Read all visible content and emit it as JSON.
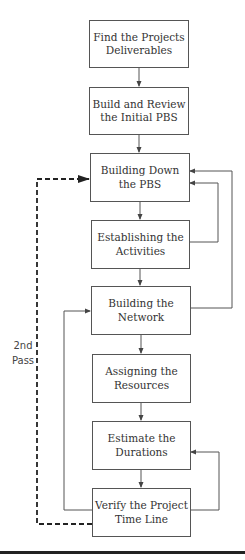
{
  "diagram": {
    "type": "flowchart",
    "nodes": [
      {
        "id": "n1",
        "label": "Find the Projects\nDeliverables"
      },
      {
        "id": "n2",
        "label": "Build and Review\nthe Initial PBS"
      },
      {
        "id": "n3",
        "label": "Building Down\nthe PBS"
      },
      {
        "id": "n4",
        "label": "Establishing the\nActivities"
      },
      {
        "id": "n5",
        "label": "Building the\nNetwork"
      },
      {
        "id": "n6",
        "label": "Assigning the\nResources"
      },
      {
        "id": "n7",
        "label": "Estimate the\nDurations"
      },
      {
        "id": "n8",
        "label": "Verify the Project\nTime Line"
      }
    ],
    "edges": [
      {
        "from": "n1",
        "to": "n2",
        "style": "solid"
      },
      {
        "from": "n2",
        "to": "n3",
        "style": "solid"
      },
      {
        "from": "n3",
        "to": "n4",
        "style": "solid"
      },
      {
        "from": "n4",
        "to": "n5",
        "style": "solid"
      },
      {
        "from": "n5",
        "to": "n6",
        "style": "solid"
      },
      {
        "from": "n6",
        "to": "n7",
        "style": "solid"
      },
      {
        "from": "n7",
        "to": "n8",
        "style": "solid"
      },
      {
        "from": "n4",
        "to": "n3",
        "style": "solid",
        "route": "right-loop"
      },
      {
        "from": "n5",
        "to": "n3",
        "style": "solid",
        "route": "right-loop-outer"
      },
      {
        "from": "n8",
        "to": "n5",
        "style": "solid",
        "route": "left-loop"
      },
      {
        "from": "n8",
        "to": "n7",
        "style": "solid",
        "route": "right-loop"
      },
      {
        "from": "n8",
        "to": "n3",
        "style": "dashed",
        "route": "left-loop-outer",
        "label": "2nd Pass"
      }
    ],
    "pass_label_line1": "2nd",
    "pass_label_line2": "Pass",
    "colors": {
      "stroke": "#555555",
      "text": "#333333",
      "rule": "#222222"
    }
  }
}
